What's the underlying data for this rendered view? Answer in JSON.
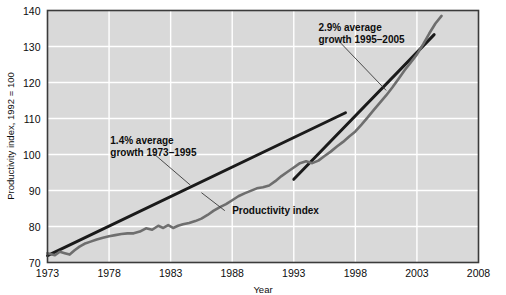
{
  "chart_data": {
    "type": "line",
    "title": "",
    "xlabel": "Year",
    "ylabel": "Productivity index, 1992 = 100",
    "xlim": [
      1973,
      2008
    ],
    "ylim": [
      70,
      140
    ],
    "xticks": [
      "1973",
      "1978",
      "1983",
      "1988",
      "1993",
      "1998",
      "2003",
      "2008"
    ],
    "yticks": [
      "70",
      "80",
      "90",
      "100",
      "110",
      "120",
      "130",
      "140"
    ],
    "grid": true,
    "legend": "none",
    "series": [
      {
        "name": "Productivity index",
        "color": "#6e6e6e",
        "x": [
          1973.0,
          1973.3,
          1973.6,
          1974.0,
          1974.4,
          1974.8,
          1975.2,
          1975.6,
          1976.0,
          1976.5,
          1977.0,
          1977.5,
          1978.0,
          1978.5,
          1979.0,
          1979.5,
          1980.0,
          1980.5,
          1981.0,
          1981.5,
          1982.0,
          1982.4,
          1982.8,
          1983.2,
          1983.6,
          1984.0,
          1984.5,
          1985.0,
          1985.5,
          1986.0,
          1986.5,
          1987.0,
          1987.5,
          1988.0,
          1988.5,
          1989.0,
          1989.5,
          1990.0,
          1990.5,
          1991.0,
          1991.5,
          1992.0,
          1992.5,
          1993.0,
          1993.5,
          1994.0,
          1994.5,
          1995.0,
          1995.5,
          1996.0,
          1996.5,
          1997.0,
          1997.5,
          1998.0,
          1998.5,
          1999.0,
          1999.5,
          2000.0,
          2000.5,
          2001.0,
          2001.5,
          2002.0,
          2002.5,
          2003.0,
          2003.5,
          2004.0,
          2004.5,
          2005.0
        ],
        "y": [
          72.6,
          72.3,
          72.0,
          73.0,
          72.6,
          72.2,
          73.4,
          74.4,
          75.2,
          75.8,
          76.4,
          76.9,
          77.3,
          77.6,
          77.9,
          78.1,
          78.1,
          78.6,
          79.5,
          79.1,
          80.2,
          79.6,
          80.4,
          79.6,
          80.2,
          80.6,
          81.0,
          81.5,
          82.2,
          83.2,
          84.4,
          85.4,
          86.2,
          87.3,
          88.4,
          89.2,
          89.9,
          90.6,
          90.9,
          91.4,
          92.6,
          94.0,
          95.2,
          96.4,
          97.6,
          98.1,
          97.6,
          98.3,
          99.6,
          100.8,
          102.2,
          103.5,
          105.0,
          106.4,
          108.3,
          110.3,
          112.4,
          114.4,
          116.4,
          118.6,
          121.0,
          123.4,
          125.6,
          127.8,
          130.6,
          133.6,
          136.4,
          138.5
        ]
      }
    ],
    "trend_lines": [
      {
        "name": "1.4% average growth 1973-1995",
        "color": "#1a1a1a",
        "x": [
          1973.0,
          1997.2
        ],
        "y": [
          71.9,
          111.6
        ],
        "label_lines": [
          "1.4% average",
          "growth 1973–1995"
        ],
        "label_x": 1978.1,
        "label_y": 102.9,
        "leader_from": [
          1981.6,
          100.3
        ],
        "leader_to": [
          1984.6,
          91.5
        ]
      },
      {
        "name": "2.9% average growth 1995-2005",
        "color": "#1a1a1a",
        "x": [
          1993.0,
          2004.4
        ],
        "y": [
          93.1,
          133.3
        ],
        "label_lines": [
          "2.9% average",
          "growth 1995–2005"
        ],
        "label_x": 1995.0,
        "label_y": 134.4,
        "leader_from": [
          1996.8,
          131.0
        ],
        "leader_to": [
          2000.5,
          117.8
        ]
      }
    ],
    "annotations": [
      {
        "name": "series-callout",
        "text": "Productivity index",
        "x": 1988.0,
        "y": 83.4,
        "leader_from": [
          1987.4,
          84.4
        ],
        "leader_to": [
          1985.5,
          89.4
        ]
      }
    ],
    "colors": {
      "plot_background": "#d9d9d9",
      "gridline": "#ffffff",
      "frame": "#3b3b3b",
      "series": "#6e6e6e",
      "trend": "#1a1a1a",
      "text": "#0d0d0d",
      "page_background": "#ffffff"
    }
  }
}
